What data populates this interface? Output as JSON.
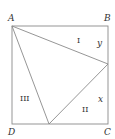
{
  "diagram": {
    "stroke_color": "#8a8a8a",
    "text_color": "#333333",
    "vertices": {
      "A": "A",
      "B": "B",
      "C": "C",
      "D": "D"
    },
    "regions": {
      "I": "I",
      "II": "II",
      "III": "III"
    },
    "segments": {
      "y": "y",
      "x": "x"
    }
  }
}
